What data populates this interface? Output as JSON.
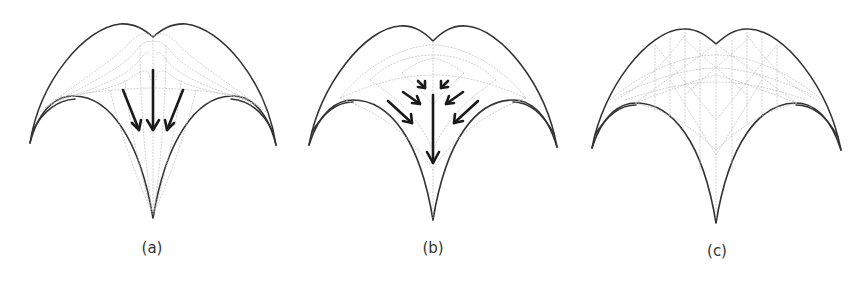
{
  "figure": {
    "panels": [
      {
        "id": "a",
        "caption": "(a)",
        "description": "vault with parallel downward force flow lines converging to the bottom cusp"
      },
      {
        "id": "b",
        "caption": "(b)",
        "description": "vault with radial force flow converging to central axis then down"
      },
      {
        "id": "c",
        "caption": "(c)",
        "description": "vault with triangulated grid / mesh pattern"
      }
    ],
    "colors": {
      "outline": "#333333",
      "guide_lines": "#bdbdbd",
      "arrows": "#1a1a1a",
      "background": "#ffffff"
    }
  }
}
